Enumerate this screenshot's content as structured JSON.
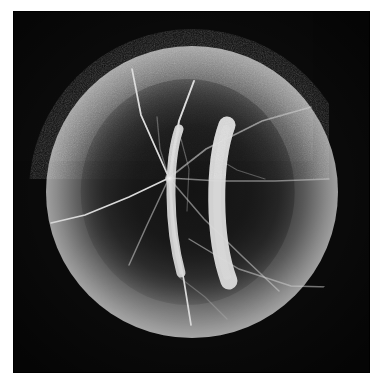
{
  "page": {
    "width": 384,
    "height": 390,
    "background_color": "#ffffff",
    "caption": ""
  },
  "plate": {
    "label": "photographic-plate",
    "background_color": "#0a0a0a",
    "left": 13,
    "top": 11,
    "width": 357,
    "height": 362
  },
  "specimen": {
    "label": "spherical specimen",
    "center_x": 191,
    "center_y": 192,
    "diameter": 326,
    "outer_rim_color": "#0e0e0e",
    "bright_ring_color": "#c2c2c2",
    "cavity_color": "#141414"
  },
  "structures": {
    "convergence_node": {
      "name": "vessel convergence point",
      "x": 168,
      "y": 178
    },
    "inner_arc": {
      "name": "inner bright crescent",
      "x": 176,
      "y": 148,
      "width": 14,
      "height": 90,
      "color": "#d5d5d5"
    },
    "outer_arc": {
      "name": "outer bright crescent",
      "x": 219,
      "y": 143,
      "width": 22,
      "height": 100,
      "color": "#e4e4e4"
    },
    "vessel_count": 11,
    "vessel_color": "#d8d8d8"
  },
  "colors": {
    "paper": "#ffffff",
    "plate_black": "#0a0a0a",
    "annulus_dark": "#101010",
    "ring_bright": "#c2c2c2",
    "cavity_dark": "#1a1a1a",
    "filament": "#d8d8d8"
  }
}
